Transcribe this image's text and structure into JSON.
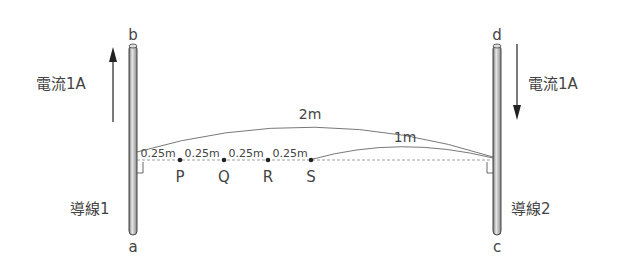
{
  "wire1": {
    "label": "導線1",
    "top_end": "b",
    "bottom_end": "a",
    "current_label": "電流1A",
    "current_direction": "up"
  },
  "wire2": {
    "label": "導線2",
    "top_end": "d",
    "bottom_end": "c",
    "current_label": "電流1A",
    "current_direction": "down"
  },
  "distances": {
    "total": "2m",
    "s_to_wire2": "1m",
    "segments": [
      "0.25m",
      "0.25m",
      "0.25m",
      "0.25m"
    ]
  },
  "points": [
    "P",
    "Q",
    "R",
    "S"
  ],
  "colors": {
    "line": "#444444",
    "wire_fill": "#c8c8c8"
  }
}
